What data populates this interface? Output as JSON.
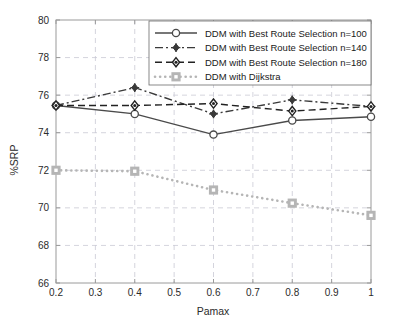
{
  "chart_data": {
    "type": "line",
    "title": "",
    "xlabel": "Pamax",
    "ylabel": "%SRP",
    "xlim": [
      0.2,
      1.0
    ],
    "ylim": [
      66,
      80
    ],
    "xticks": [
      "0.2",
      "0.3",
      "0.4",
      "0.5",
      "0.6",
      "0.7",
      "0.8",
      "0.9",
      "1"
    ],
    "xtick_values": [
      0.2,
      0.3,
      0.4,
      0.5,
      0.6,
      0.7,
      0.8,
      0.9,
      1.0
    ],
    "yticks": [
      "66",
      "68",
      "70",
      "72",
      "74",
      "76",
      "78",
      "80"
    ],
    "ytick_values": [
      66,
      68,
      70,
      72,
      74,
      76,
      78,
      80
    ],
    "grid": true,
    "grid_style": "dashed",
    "legend_position": "top-right",
    "x": [
      0.2,
      0.4,
      0.6,
      0.8,
      1.0
    ],
    "series": [
      {
        "name": "DDM with Best Route Selection n=100",
        "values": [
          75.45,
          75.0,
          73.9,
          74.65,
          74.85
        ],
        "color": "#4a4a4a",
        "line_style": "solid",
        "marker": "circle"
      },
      {
        "name": "DDM with Best Route Selection n=140",
        "values": [
          75.45,
          76.4,
          75.0,
          75.75,
          75.4
        ],
        "color": "#3a3a3a",
        "line_style": "dashdot",
        "marker": "plus-diamond"
      },
      {
        "name": "DDM with Best Route Selection n=180",
        "values": [
          75.45,
          75.45,
          75.55,
          75.15,
          75.4
        ],
        "color": "#222222",
        "line_style": "dashed",
        "marker": "diamond"
      },
      {
        "name": "DDM with Dijkstra",
        "values": [
          72.0,
          71.95,
          70.95,
          70.25,
          69.6
        ],
        "color": "#b5b5b5",
        "line_style": "dotted",
        "marker": "square"
      }
    ]
  },
  "axes": {
    "x_title": "Pamax",
    "y_title": "%SRP"
  },
  "legend": {
    "items": [
      {
        "label": "DDM with Best Route Selection n=100"
      },
      {
        "label": "DDM with Best Route Selection n=140"
      },
      {
        "label": "DDM with Best Route Selection n=180"
      },
      {
        "label": "DDM with Dijkstra"
      }
    ]
  },
  "colors": {
    "grid": "#c9c9d4",
    "axis": "#9a9a9a",
    "text": "#2b2b2b",
    "dijkstra": "#b5b5b5"
  }
}
